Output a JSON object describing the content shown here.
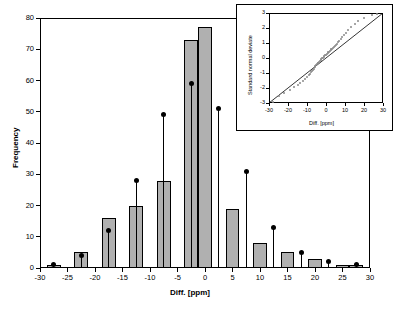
{
  "chart_data": [
    {
      "type": "bar",
      "id": "main-histogram",
      "title": "",
      "xlabel": "Diff. [ppm]",
      "ylabel": "Frequency",
      "xlim": [
        -30,
        30
      ],
      "ylim": [
        0,
        80
      ],
      "xticks": [
        -30,
        -25,
        -20,
        -15,
        -10,
        -5,
        0,
        5,
        10,
        15,
        20,
        25,
        30
      ],
      "yticks": [
        0,
        10,
        20,
        30,
        40,
        50,
        60,
        70,
        80
      ],
      "grid": false,
      "bar_color": "#b0b0b0",
      "bar_edge_color": "#000000",
      "bin_width": 2.5,
      "categories": [
        -27.5,
        -25,
        -22.5,
        -20,
        -17.5,
        -15,
        -12.5,
        -10,
        -7.5,
        -5,
        -2.5,
        0,
        2.5,
        5,
        7.5,
        10,
        12.5,
        15,
        17.5,
        20,
        22.5,
        25,
        27.5
      ],
      "values": [
        1,
        0,
        5,
        0,
        16,
        0,
        20,
        0,
        28,
        0,
        73,
        77,
        0,
        19,
        0,
        8,
        0,
        5,
        0,
        3,
        0,
        1,
        1
      ],
      "overlay_points": {
        "name": "Cumulative marker",
        "x": [
          -27.5,
          -22.5,
          -17.5,
          -12.5,
          -7.5,
          -2.5,
          2.5,
          7.5,
          12.5,
          17.5,
          22.5,
          27.5
        ],
        "y": [
          1,
          4,
          12,
          28,
          49,
          59,
          51,
          31,
          13,
          5,
          2,
          1
        ],
        "color": "#000000",
        "style": "stem-with-dot"
      }
    },
    {
      "type": "scatter",
      "id": "inset-qq-plot",
      "title": "",
      "xlabel": "Diff. [ppm]",
      "ylabel": "Standard normal deviate",
      "xlim": [
        -30,
        30
      ],
      "ylim": [
        -3,
        3
      ],
      "xticks": [
        -30,
        -20,
        -10,
        0,
        10,
        20,
        30
      ],
      "yticks": [
        -3,
        -2,
        -1,
        0,
        1,
        2,
        3
      ],
      "grid": false,
      "point_color": "#8a8a8a",
      "reference_line": {
        "from": [
          -30,
          -3
        ],
        "to": [
          30,
          3
        ],
        "color": "#000000"
      },
      "x": [
        -28,
        -25,
        -22,
        -19,
        -17,
        -15,
        -13.5,
        -12,
        -11,
        -10,
        -9.2,
        -8.5,
        -8,
        -7.4,
        -7,
        -6.5,
        -6,
        -5.6,
        -5.2,
        -4.8,
        -4.4,
        -4,
        -3.6,
        -3.2,
        -2.8,
        -2.4,
        -2,
        -1.6,
        -1.2,
        -0.8,
        -0.4,
        0,
        0.4,
        0.8,
        1.2,
        1.6,
        2,
        2.4,
        2.8,
        3.2,
        3.6,
        4,
        4.5,
        5,
        5.6,
        6.2,
        7,
        7.8,
        8.6,
        9.5,
        10.5,
        11.5,
        13,
        15,
        17,
        20,
        24,
        27
      ],
      "y": [
        -2.9,
        -2.55,
        -2.3,
        -2.1,
        -1.95,
        -1.8,
        -1.65,
        -1.5,
        -1.38,
        -1.25,
        -1.15,
        -1.05,
        -0.95,
        -0.85,
        -0.78,
        -0.7,
        -0.62,
        -0.55,
        -0.48,
        -0.42,
        -0.35,
        -0.3,
        -0.24,
        -0.18,
        -0.12,
        -0.07,
        -0.02,
        0.03,
        0.08,
        0.13,
        0.18,
        0.23,
        0.28,
        0.33,
        0.38,
        0.43,
        0.48,
        0.53,
        0.58,
        0.63,
        0.68,
        0.74,
        0.8,
        0.88,
        0.96,
        1.05,
        1.15,
        1.28,
        1.4,
        1.55,
        1.7,
        1.85,
        2.05,
        2.25,
        2.45,
        2.65,
        2.85,
        2.95
      ]
    }
  ],
  "main": {
    "xlabel": "Diff. [ppm]",
    "ylabel": "Frequency",
    "xticks": [
      "-30",
      "-25",
      "-20",
      "-15",
      "-10",
      "-5",
      "0",
      "5",
      "10",
      "15",
      "20",
      "25",
      "30"
    ],
    "yticks": [
      "0",
      "10",
      "20",
      "30",
      "40",
      "50",
      "60",
      "70",
      "80"
    ]
  },
  "inset": {
    "xlabel": "Diff. [ppm]",
    "ylabel": "Standard normal deviate",
    "xticks": [
      "-30",
      "-20",
      "-10",
      "0",
      "10",
      "20",
      "30"
    ],
    "yticks": [
      "-3",
      "-2",
      "-1",
      "0",
      "1",
      "2",
      "3"
    ]
  }
}
